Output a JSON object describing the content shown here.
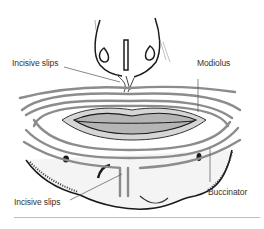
{
  "figure": {
    "labels": {
      "incisive_slips_upper": "Incisive slips",
      "modiolus": "Modiolus",
      "incisive_slips_lower": "Incisive slips",
      "buccinator": "Buccinator"
    },
    "colors": {
      "muscle_band": "#8c8c8c",
      "lip": "#b5b5b5",
      "outline": "#1a1a1a",
      "leader_line": "#555555",
      "rule": "#bdbdbd"
    }
  }
}
